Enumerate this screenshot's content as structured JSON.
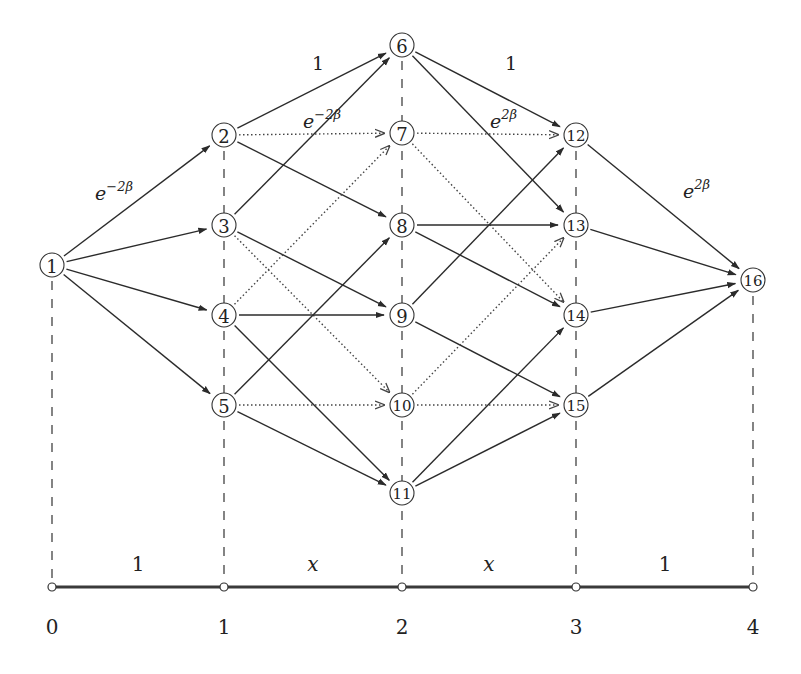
{
  "diagram": {
    "columns": [
      {
        "index": 0,
        "x": 52,
        "label": "0"
      },
      {
        "index": 1,
        "x": 224,
        "label": "1"
      },
      {
        "index": 2,
        "x": 402,
        "label": "2"
      },
      {
        "index": 3,
        "x": 576,
        "label": "3"
      },
      {
        "index": 4,
        "x": 753,
        "label": "4"
      }
    ],
    "nodes": [
      {
        "id": 1,
        "label": "1",
        "x": 52,
        "y": 265
      },
      {
        "id": 2,
        "label": "2",
        "x": 224,
        "y": 135
      },
      {
        "id": 3,
        "label": "3",
        "x": 224,
        "y": 225
      },
      {
        "id": 4,
        "label": "4",
        "x": 224,
        "y": 315
      },
      {
        "id": 5,
        "label": "5",
        "x": 224,
        "y": 405
      },
      {
        "id": 6,
        "label": "6",
        "x": 402,
        "y": 45
      },
      {
        "id": 7,
        "label": "7",
        "x": 402,
        "y": 133
      },
      {
        "id": 8,
        "label": "8",
        "x": 402,
        "y": 225
      },
      {
        "id": 9,
        "label": "9",
        "x": 402,
        "y": 315
      },
      {
        "id": 10,
        "label": "10",
        "x": 402,
        "y": 405
      },
      {
        "id": 11,
        "label": "11",
        "x": 402,
        "y": 493
      },
      {
        "id": 12,
        "label": "12",
        "x": 576,
        "y": 135
      },
      {
        "id": 13,
        "label": "13",
        "x": 576,
        "y": 225
      },
      {
        "id": 14,
        "label": "14",
        "x": 576,
        "y": 315
      },
      {
        "id": 15,
        "label": "15",
        "x": 576,
        "y": 405
      },
      {
        "id": 16,
        "label": "16",
        "x": 753,
        "y": 280
      }
    ],
    "edges": [
      {
        "from": 1,
        "to": 2,
        "style": "solid"
      },
      {
        "from": 1,
        "to": 3,
        "style": "solid"
      },
      {
        "from": 1,
        "to": 4,
        "style": "solid"
      },
      {
        "from": 1,
        "to": 5,
        "style": "solid"
      },
      {
        "from": 2,
        "to": 6,
        "style": "solid"
      },
      {
        "from": 2,
        "to": 7,
        "style": "dotted"
      },
      {
        "from": 2,
        "to": 8,
        "style": "solid"
      },
      {
        "from": 3,
        "to": 6,
        "style": "solid"
      },
      {
        "from": 3,
        "to": 9,
        "style": "solid"
      },
      {
        "from": 3,
        "to": 10,
        "style": "dotted"
      },
      {
        "from": 4,
        "to": 7,
        "style": "dotted"
      },
      {
        "from": 4,
        "to": 9,
        "style": "solid"
      },
      {
        "from": 4,
        "to": 11,
        "style": "solid"
      },
      {
        "from": 5,
        "to": 8,
        "style": "solid"
      },
      {
        "from": 5,
        "to": 10,
        "style": "dotted"
      },
      {
        "from": 5,
        "to": 11,
        "style": "solid"
      },
      {
        "from": 6,
        "to": 12,
        "style": "solid"
      },
      {
        "from": 6,
        "to": 13,
        "style": "solid"
      },
      {
        "from": 7,
        "to": 12,
        "style": "dotted"
      },
      {
        "from": 7,
        "to": 14,
        "style": "dotted"
      },
      {
        "from": 8,
        "to": 13,
        "style": "solid"
      },
      {
        "from": 8,
        "to": 14,
        "style": "solid"
      },
      {
        "from": 9,
        "to": 12,
        "style": "solid"
      },
      {
        "from": 9,
        "to": 15,
        "style": "solid"
      },
      {
        "from": 10,
        "to": 13,
        "style": "dotted"
      },
      {
        "from": 10,
        "to": 15,
        "style": "dotted"
      },
      {
        "from": 11,
        "to": 14,
        "style": "solid"
      },
      {
        "from": 11,
        "to": 15,
        "style": "solid"
      },
      {
        "from": 12,
        "to": 16,
        "style": "solid"
      },
      {
        "from": 13,
        "to": 16,
        "style": "solid"
      },
      {
        "from": 14,
        "to": 16,
        "style": "solid"
      },
      {
        "from": 15,
        "to": 16,
        "style": "solid"
      }
    ],
    "edge_labels": [
      {
        "id": "w-1-2",
        "base": "e",
        "sup": "−2β",
        "x": 95,
        "y": 200
      },
      {
        "id": "w-2-6",
        "base": "1",
        "sup": "",
        "x": 312,
        "y": 70
      },
      {
        "id": "w-2-7",
        "base": "e",
        "sup": "−2β",
        "x": 303,
        "y": 128
      },
      {
        "id": "w-6-12",
        "base": "1",
        "sup": "",
        "x": 505,
        "y": 70
      },
      {
        "id": "w-7-12",
        "base": "e",
        "sup": "2β",
        "x": 490,
        "y": 128
      },
      {
        "id": "w-12-16",
        "base": "e",
        "sup": "2β",
        "x": 683,
        "y": 198
      }
    ],
    "axis": {
      "y": 587,
      "label_y": 627,
      "segment_labels": [
        {
          "text": "1",
          "x": 138,
          "italic": false
        },
        {
          "text": "x",
          "x": 313,
          "italic": true
        },
        {
          "text": "x",
          "x": 489,
          "italic": true
        },
        {
          "text": "1",
          "x": 665,
          "italic": false
        }
      ]
    }
  }
}
